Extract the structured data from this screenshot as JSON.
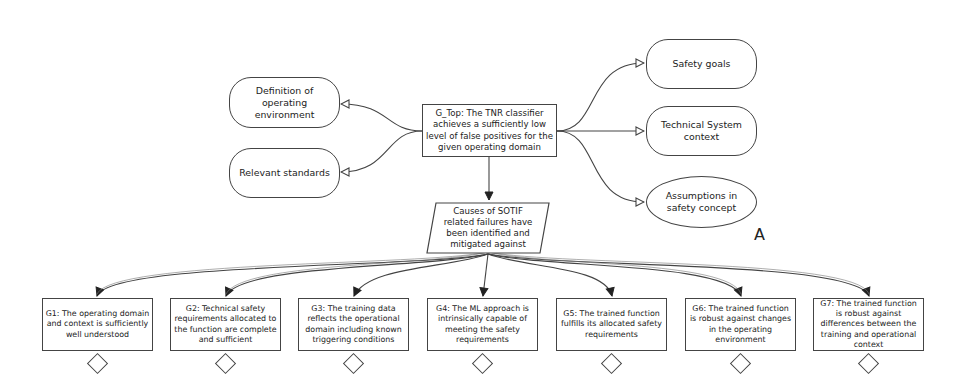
{
  "diagram": {
    "type": "GSN safety argument",
    "top_goal": {
      "id": "G_Top",
      "text": "G_Top: The TNR classifier achieves a sufficiently low level of false positives for the given operating domain"
    },
    "left_contexts": [
      {
        "text": "Definition of operating environment"
      },
      {
        "text": "Relevant standards"
      }
    ],
    "right_contexts": [
      {
        "text": "Safety goals"
      },
      {
        "text": "Technical System context"
      }
    ],
    "assumption": {
      "text": "Assumptions in safety concept",
      "label": "A"
    },
    "strategy": {
      "text": "Causes of SOTIF related failures have been identified and mitigated against"
    },
    "subgoals": [
      {
        "id": "G1",
        "text": "G1: The operating domain and context is sufficiently well understood"
      },
      {
        "id": "G2",
        "text": "G2: Technical safety requirements allocated to the function are complete and sufficient"
      },
      {
        "id": "G3",
        "text": "G3: The training data reflects the operational domain including known triggering conditions"
      },
      {
        "id": "G4",
        "text": "G4: The ML approach is intrinsically capable of meeting the safety requirements"
      },
      {
        "id": "G5",
        "text": "G5: The trained function fulfills its allocated safety requirements"
      },
      {
        "id": "G6",
        "text": "G6: The trained function is robust against changes in the operating environment"
      },
      {
        "id": "G7",
        "text": "G7: The trained function is robust against differences between the training and operational context"
      }
    ],
    "undeveloped_marker": "diamond",
    "colors": {
      "line": "#444444",
      "background": "#ffffff",
      "text": "#222222"
    }
  }
}
